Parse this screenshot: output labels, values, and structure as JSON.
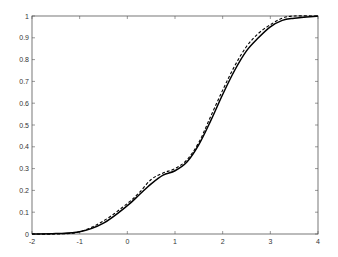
{
  "chart_data": {
    "type": "line",
    "title": "",
    "xlabel": "",
    "ylabel": "",
    "xlim": [
      -2,
      4
    ],
    "ylim": [
      0,
      1
    ],
    "grid": false,
    "legend": null,
    "x_ticks": [
      "-2",
      "-1",
      "0",
      "1",
      "2",
      "3",
      "4"
    ],
    "y_ticks": [
      "0",
      "0.1",
      "0.2",
      "0.3",
      "0.4",
      "0.5",
      "0.6",
      "0.7",
      "0.8",
      "0.9",
      "1"
    ],
    "series": [
      {
        "name": "smooth CDF",
        "style": "solid",
        "color": "#000000",
        "x": [
          -2,
          -1.5,
          -1,
          -0.5,
          0,
          0.25,
          0.5,
          0.75,
          1,
          1.25,
          1.5,
          1.75,
          2,
          2.25,
          2.5,
          2.75,
          3,
          3.25,
          3.5,
          4
        ],
        "y": [
          0,
          0.002,
          0.01,
          0.05,
          0.13,
          0.18,
          0.23,
          0.27,
          0.29,
          0.33,
          0.41,
          0.52,
          0.64,
          0.75,
          0.84,
          0.9,
          0.95,
          0.98,
          0.99,
          1.0
        ]
      },
      {
        "name": "empirical CDF",
        "style": "dashed",
        "color": "#000000",
        "x": [
          -2,
          -1.5,
          -1,
          -0.5,
          0,
          0.25,
          0.5,
          0.75,
          1,
          1.25,
          1.5,
          1.75,
          2,
          2.25,
          2.5,
          2.75,
          3,
          3.25,
          3.5,
          4
        ],
        "y": [
          0,
          0.0,
          0.01,
          0.06,
          0.14,
          0.19,
          0.25,
          0.28,
          0.3,
          0.34,
          0.42,
          0.54,
          0.66,
          0.77,
          0.86,
          0.92,
          0.96,
          0.99,
          1.0,
          1.0
        ]
      }
    ]
  },
  "plot_box": {
    "left": 32,
    "right": 318,
    "top": 16,
    "bottom": 234
  }
}
